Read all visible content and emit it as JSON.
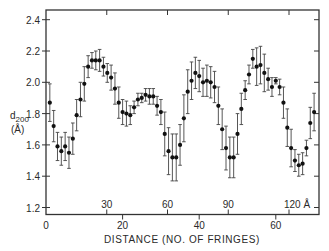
{
  "chart_data": {
    "type": "scatter",
    "title": "",
    "xlabel": "DISTANCE (NO. OF FRINGES)",
    "ylabel": "d200 (Å)",
    "ylabel_main": "d",
    "ylabel_sub": "200",
    "ylabel_unit": "(Å)",
    "ylim": [
      1.17,
      2.46
    ],
    "xlim": [
      0,
      71
    ],
    "grid": false,
    "legend": null,
    "y_ticks": [
      1.2,
      1.4,
      1.6,
      1.8,
      2.0,
      2.2,
      2.4
    ],
    "y_tick_labels": [
      "1.2",
      "1.4",
      "1.6",
      "1.8",
      "2.0",
      "2.2",
      "2.4"
    ],
    "x_ticks": [
      0,
      20,
      40,
      60
    ],
    "x_tick_labels": [
      "0",
      "20",
      "40",
      "60"
    ],
    "secondary_x_ticks_angstrom": [
      30,
      60,
      90,
      120
    ],
    "secondary_x_tick_labels": [
      "30",
      "60",
      "90",
      "120 Å"
    ],
    "error_bars": true,
    "x": [
      1,
      2,
      3,
      4,
      5,
      6,
      7,
      8,
      9,
      10,
      11,
      12,
      13,
      14,
      15,
      16,
      17,
      18,
      19,
      20,
      21,
      22,
      23,
      24,
      25,
      26,
      27,
      28,
      29,
      30,
      31,
      32,
      33,
      34,
      35,
      36,
      37,
      38,
      39,
      40,
      41,
      42,
      43,
      44,
      45,
      46,
      47,
      48,
      49,
      50,
      51,
      52,
      53,
      54,
      55,
      56,
      57,
      58,
      59,
      60,
      61,
      62,
      63,
      64,
      65,
      66,
      67,
      68,
      69,
      70
    ],
    "values": [
      1.87,
      1.72,
      1.59,
      1.56,
      1.59,
      1.55,
      1.64,
      1.79,
      1.89,
      1.99,
      2.1,
      2.14,
      2.14,
      2.14,
      2.1,
      2.06,
      2.03,
      1.96,
      1.87,
      1.81,
      1.8,
      1.79,
      1.84,
      1.89,
      1.9,
      1.92,
      1.91,
      1.91,
      1.85,
      1.81,
      1.67,
      1.56,
      1.52,
      1.52,
      1.6,
      1.77,
      1.94,
      2.01,
      2.06,
      2.04,
      2.0,
      2.01,
      2.0,
      1.97,
      1.85,
      1.7,
      1.58,
      1.52,
      1.52,
      1.67,
      1.83,
      1.95,
      2.05,
      2.15,
      2.1,
      2.11,
      2.06,
      2.02,
      1.97,
      2.01,
      1.97,
      1.87,
      1.71,
      1.58,
      1.5,
      1.47,
      1.48,
      1.58,
      1.74,
      1.81
    ],
    "errors": [
      0.12,
      0.1,
      0.09,
      0.09,
      0.09,
      0.1,
      0.1,
      0.1,
      0.11,
      0.11,
      0.07,
      0.05,
      0.06,
      0.07,
      0.06,
      0.06,
      0.08,
      0.1,
      0.1,
      0.08,
      0.08,
      0.06,
      0.04,
      0.04,
      0.03,
      0.04,
      0.05,
      0.05,
      0.06,
      0.08,
      0.14,
      0.15,
      0.15,
      0.15,
      0.13,
      0.15,
      0.14,
      0.12,
      0.1,
      0.1,
      0.09,
      0.1,
      0.1,
      0.1,
      0.12,
      0.13,
      0.14,
      0.13,
      0.13,
      0.13,
      0.1,
      0.06,
      0.06,
      0.06,
      0.12,
      0.12,
      0.12,
      0.07,
      0.06,
      0.02,
      0.05,
      0.1,
      0.12,
      0.12,
      0.07,
      0.07,
      0.07,
      0.05,
      0.1,
      0.12
    ]
  },
  "axis_text": {
    "xlabel": "DISTANCE (NO. OF FRINGES)",
    "ylabel_main": "d",
    "ylabel_sub": "200",
    "ylabel_unit": "(Å)"
  }
}
